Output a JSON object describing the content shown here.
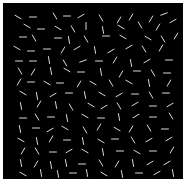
{
  "stimulus": {
    "background": "#000000",
    "line_color": "#d9d9d9",
    "line_length": 7,
    "line_width": 1,
    "segments": [
      [
        15,
        14,
        30
      ],
      [
        30,
        14,
        0
      ],
      [
        52,
        13,
        60
      ],
      [
        64,
        13,
        0
      ],
      [
        78,
        13,
        -30
      ],
      [
        98,
        15,
        60
      ],
      [
        116,
        17,
        -60
      ],
      [
        128,
        14,
        -60
      ],
      [
        148,
        16,
        -60
      ],
      [
        161,
        11,
        -20
      ],
      [
        24,
        23,
        30
      ],
      [
        38,
        26,
        0
      ],
      [
        55,
        25,
        30
      ],
      [
        70,
        26,
        60
      ],
      [
        83,
        23,
        90
      ],
      [
        100,
        27,
        80
      ],
      [
        118,
        24,
        30
      ],
      [
        137,
        22,
        60
      ],
      [
        155,
        24,
        -60
      ],
      [
        170,
        18,
        -30
      ],
      [
        20,
        34,
        0
      ],
      [
        31,
        35,
        60
      ],
      [
        55,
        35,
        0
      ],
      [
        66,
        37,
        80
      ],
      [
        83,
        36,
        60
      ],
      [
        103,
        33,
        0
      ],
      [
        120,
        34,
        30
      ],
      [
        145,
        35,
        30
      ],
      [
        160,
        36,
        60
      ],
      [
        173,
        33,
        -60
      ],
      [
        14,
        45,
        30
      ],
      [
        28,
        48,
        0
      ],
      [
        44,
        46,
        0
      ],
      [
        60,
        47,
        -60
      ],
      [
        74,
        45,
        -30
      ],
      [
        92,
        47,
        80
      ],
      [
        108,
        48,
        -30
      ],
      [
        126,
        44,
        -30
      ],
      [
        141,
        46,
        60
      ],
      [
        158,
        45,
        -60
      ],
      [
        16,
        58,
        0
      ],
      [
        30,
        58,
        0
      ],
      [
        46,
        57,
        80
      ],
      [
        62,
        60,
        60
      ],
      [
        80,
        58,
        -20
      ],
      [
        96,
        58,
        0
      ],
      [
        112,
        57,
        -60
      ],
      [
        128,
        60,
        80
      ],
      [
        144,
        58,
        -30
      ],
      [
        166,
        57,
        0
      ],
      [
        17,
        68,
        60
      ],
      [
        30,
        69,
        -60
      ],
      [
        48,
        68,
        80
      ],
      [
        64,
        67,
        30
      ],
      [
        78,
        69,
        0
      ],
      [
        98,
        69,
        80
      ],
      [
        118,
        71,
        -60
      ],
      [
        134,
        68,
        0
      ],
      [
        150,
        70,
        60
      ],
      [
        164,
        70,
        0
      ],
      [
        16,
        79,
        -60
      ],
      [
        28,
        79,
        0
      ],
      [
        44,
        80,
        30
      ],
      [
        57,
        80,
        0
      ],
      [
        76,
        81,
        -60
      ],
      [
        90,
        80,
        30
      ],
      [
        108,
        80,
        60
      ],
      [
        126,
        79,
        30
      ],
      [
        146,
        80,
        80
      ],
      [
        166,
        80,
        -60
      ],
      [
        20,
        90,
        30
      ],
      [
        34,
        93,
        80
      ],
      [
        50,
        92,
        -30
      ],
      [
        66,
        90,
        0
      ],
      [
        82,
        92,
        80
      ],
      [
        99,
        91,
        30
      ],
      [
        116,
        92,
        -30
      ],
      [
        132,
        91,
        0
      ],
      [
        148,
        92,
        60
      ],
      [
        163,
        90,
        0
      ],
      [
        18,
        103,
        80
      ],
      [
        36,
        101,
        -60
      ],
      [
        53,
        102,
        80
      ],
      [
        68,
        104,
        60
      ],
      [
        88,
        102,
        30
      ],
      [
        101,
        104,
        -30
      ],
      [
        116,
        103,
        60
      ],
      [
        132,
        101,
        -30
      ],
      [
        150,
        103,
        0
      ],
      [
        167,
        102,
        -30
      ],
      [
        20,
        115,
        0
      ],
      [
        34,
        114,
        60
      ],
      [
        48,
        114,
        0
      ],
      [
        64,
        115,
        80
      ],
      [
        82,
        113,
        30
      ],
      [
        98,
        115,
        0
      ],
      [
        116,
        114,
        80
      ],
      [
        133,
        113,
        -30
      ],
      [
        150,
        114,
        0
      ],
      [
        168,
        113,
        60
      ],
      [
        17,
        126,
        80
      ],
      [
        33,
        125,
        0
      ],
      [
        47,
        127,
        -30
      ],
      [
        62,
        125,
        30
      ],
      [
        82,
        127,
        60
      ],
      [
        96,
        124,
        -60
      ],
      [
        114,
        126,
        30
      ],
      [
        128,
        126,
        -60
      ],
      [
        146,
        125,
        60
      ],
      [
        162,
        126,
        0
      ],
      [
        18,
        137,
        30
      ],
      [
        34,
        138,
        80
      ],
      [
        48,
        136,
        -60
      ],
      [
        64,
        137,
        0
      ],
      [
        80,
        138,
        80
      ],
      [
        98,
        138,
        30
      ],
      [
        112,
        136,
        0
      ],
      [
        130,
        137,
        60
      ],
      [
        146,
        137,
        -30
      ],
      [
        166,
        136,
        -30
      ],
      [
        20,
        148,
        -60
      ],
      [
        34,
        148,
        60
      ],
      [
        50,
        149,
        0
      ],
      [
        66,
        148,
        -30
      ],
      [
        82,
        148,
        30
      ],
      [
        100,
        149,
        80
      ],
      [
        117,
        148,
        0
      ],
      [
        134,
        149,
        30
      ],
      [
        150,
        148,
        0
      ],
      [
        169,
        147,
        -60
      ],
      [
        18,
        160,
        80
      ],
      [
        33,
        161,
        -60
      ],
      [
        48,
        162,
        80
      ],
      [
        63,
        160,
        80
      ],
      [
        79,
        161,
        0
      ],
      [
        98,
        160,
        60
      ],
      [
        114,
        161,
        -60
      ],
      [
        130,
        160,
        80
      ],
      [
        147,
        160,
        -30
      ],
      [
        164,
        160,
        -30
      ],
      [
        20,
        171,
        30
      ],
      [
        38,
        170,
        80
      ],
      [
        55,
        171,
        80
      ],
      [
        70,
        170,
        0
      ],
      [
        84,
        170,
        80
      ],
      [
        101,
        171,
        30
      ],
      [
        119,
        171,
        80
      ],
      [
        136,
        170,
        0
      ],
      [
        154,
        170,
        -30
      ],
      [
        170,
        170,
        80
      ]
    ]
  }
}
